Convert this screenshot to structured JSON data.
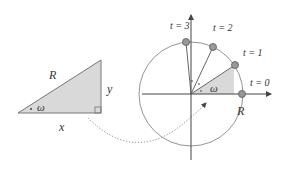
{
  "diagram": {
    "left_triangle": {
      "hypotenuse_label": "R",
      "vertical_label": "y",
      "base_label": "x",
      "angle_label": "ω",
      "fill": "#d9d9d9"
    },
    "circle": {
      "radius_label": "R",
      "angle_label": "ω",
      "points": [
        {
          "label": "t = 0"
        },
        {
          "label": "t = 1"
        },
        {
          "label": "t = 2"
        },
        {
          "label": "t = 3"
        }
      ]
    },
    "colors": {
      "stroke": "#555555",
      "shade": "#d9d9d9",
      "text": "#333333"
    }
  }
}
